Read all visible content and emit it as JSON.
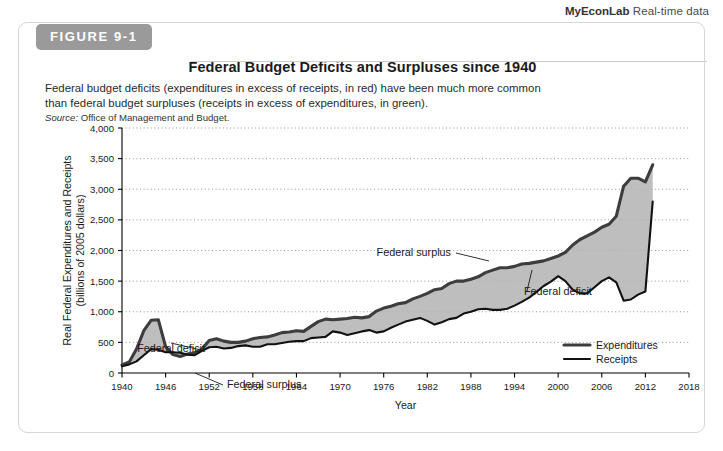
{
  "branding": {
    "brand": "MyEconLab",
    "suffix": " Real-time data"
  },
  "figure": {
    "tab_label": "FIGURE 9-1",
    "title": "Federal Budget Deficits and Surpluses since 1940",
    "caption": "Federal budget deficits (expenditures in excess of receipts, in red) have been much more common than federal budget surpluses (receipts in excess of expenditures, in green).",
    "source_prefix": "Source:",
    "source_text": " Office of Management and Budget."
  },
  "annotations": [
    {
      "id": "deficit-left",
      "label": "Federal deficit",
      "x": 186,
      "y": 329
    },
    {
      "id": "surplus-left",
      "label": "Federal surplus",
      "x": 208,
      "y": 365
    },
    {
      "id": "surplus-right",
      "label": "Federal surplus",
      "x": 432,
      "y": 233
    },
    {
      "id": "deficit-right",
      "label": "Federal deficit",
      "x": 505,
      "y": 272
    }
  ],
  "legend": {
    "items": [
      {
        "name": "Expenditures",
        "color": "#3d3d3d",
        "width": 3.1
      },
      {
        "name": "Receipts",
        "color": "#111111",
        "width": 2.1
      }
    ]
  },
  "chart_data": {
    "type": "area",
    "title": "Federal Budget Deficits and Surpluses since 1940",
    "xlabel": "Year",
    "ylabel": "Real Federal Expenditures and Receipts (billions of 2005 dollars)",
    "ylabel_line1": "Real Federal Expenditures and Receipts",
    "ylabel_line2": "(billions of 2005 dollars)",
    "xlim": [
      1940,
      2018
    ],
    "ylim": [
      0,
      4000
    ],
    "ytick_step": 500,
    "xtick_step": 6,
    "grid": true,
    "legend_position": "bottom-right",
    "xticks": [
      1940,
      1946,
      1952,
      1958,
      1964,
      1970,
      1976,
      1982,
      1988,
      1994,
      2000,
      2006,
      2012,
      2018
    ],
    "yticks": [
      0,
      500,
      1000,
      1500,
      2000,
      2500,
      3000,
      3500,
      4000
    ],
    "ytick_labels": [
      "0",
      "500",
      "1,000",
      "1,500",
      "2,000",
      "2,500",
      "3,000",
      "3,500",
      "4,000"
    ],
    "fill_label": "Gap shaded gray: deficit when expenditures exceed receipts",
    "x": [
      1940,
      1941,
      1942,
      1943,
      1944,
      1945,
      1946,
      1947,
      1948,
      1949,
      1950,
      1951,
      1952,
      1953,
      1954,
      1955,
      1956,
      1957,
      1958,
      1959,
      1960,
      1961,
      1962,
      1963,
      1964,
      1965,
      1966,
      1967,
      1968,
      1969,
      1970,
      1971,
      1972,
      1973,
      1974,
      1975,
      1976,
      1977,
      1978,
      1979,
      1980,
      1981,
      1982,
      1983,
      1984,
      1985,
      1986,
      1987,
      1988,
      1989,
      1990,
      1991,
      1992,
      1993,
      1994,
      1995,
      1996,
      1997,
      1998,
      1999,
      2000,
      2001,
      2002,
      2003,
      2004,
      2005,
      2006,
      2007,
      2008,
      2009,
      2010,
      2011,
      2012,
      2013
    ],
    "series": [
      {
        "name": "Expenditures",
        "color": "#3d3d3d",
        "values": [
          130,
          180,
          390,
          690,
          860,
          870,
          430,
          300,
          270,
          310,
          330,
          390,
          530,
          560,
          520,
          500,
          500,
          520,
          560,
          580,
          590,
          620,
          660,
          670,
          690,
          680,
          760,
          840,
          880,
          870,
          880,
          890,
          910,
          900,
          920,
          1010,
          1060,
          1090,
          1130,
          1150,
          1210,
          1250,
          1300,
          1360,
          1380,
          1460,
          1500,
          1500,
          1530,
          1570,
          1640,
          1680,
          1720,
          1720,
          1740,
          1780,
          1790,
          1810,
          1830,
          1870,
          1910,
          1970,
          2090,
          2180,
          2240,
          2300,
          2380,
          2430,
          2560,
          3050,
          3180,
          3180,
          3120,
          3400
        ]
      },
      {
        "name": "Receipts",
        "color": "#111111",
        "values": [
          110,
          140,
          190,
          290,
          390,
          380,
          340,
          340,
          330,
          300,
          290,
          360,
          420,
          430,
          400,
          410,
          440,
          450,
          430,
          430,
          470,
          470,
          490,
          510,
          520,
          520,
          570,
          580,
          590,
          680,
          660,
          620,
          650,
          680,
          700,
          660,
          680,
          740,
          790,
          840,
          870,
          900,
          850,
          790,
          830,
          880,
          900,
          970,
          1000,
          1040,
          1050,
          1030,
          1030,
          1050,
          1100,
          1160,
          1230,
          1320,
          1420,
          1490,
          1580,
          1500,
          1360,
          1300,
          1300,
          1400,
          1500,
          1560,
          1480,
          1180,
          1200,
          1280,
          1330,
          2800
        ]
      }
    ],
    "notes": [
      "Expenditures peak near 870 during World War II (1944-45).",
      "Receipts exceed expenditures 1998-2001, producing a federal surplus.",
      "Deficit widens sharply after 2008; expenditures reach about 3,400."
    ]
  }
}
